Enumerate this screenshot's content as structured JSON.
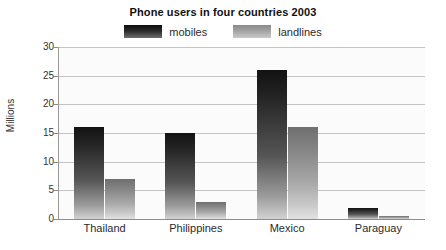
{
  "chart_data": {
    "type": "bar",
    "title": "Phone users in four countries 2003",
    "xlabel": "",
    "ylabel": "Millions",
    "ylim": [
      0,
      30
    ],
    "ytick_step": 5,
    "yticks": [
      30,
      25,
      20,
      15,
      10,
      5,
      0
    ],
    "grid": true,
    "legend_position": "top-center",
    "categories": [
      "Thailand",
      "Philippines",
      "Mexico",
      "Paraguay"
    ],
    "series": [
      {
        "name": "mobiles",
        "color": "#1b1b1b",
        "values": [
          16,
          15,
          26,
          2
        ]
      },
      {
        "name": "landlines",
        "color": "#a0a0a0",
        "values": [
          7,
          3,
          16,
          0.5
        ]
      }
    ]
  },
  "legend": {
    "items": [
      {
        "label": "mobiles",
        "swatch": "mobiles-swatch"
      },
      {
        "label": "landlines",
        "swatch": "landlines-swatch"
      }
    ]
  }
}
